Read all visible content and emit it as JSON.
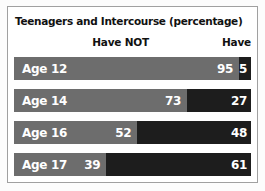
{
  "chart_data": {
    "type": "bar",
    "orientation": "horizontal",
    "stacked": true,
    "title": "Teenagers and Intercourse (percentage)",
    "categories": [
      "Age 12",
      "Age 14",
      "Age 16",
      "Age 17"
    ],
    "series": [
      {
        "name": "Have NOT",
        "values": [
          95,
          73,
          52,
          39
        ],
        "color": "#6d6d6d"
      },
      {
        "name": "Have",
        "values": [
          5,
          27,
          48,
          61
        ],
        "color": "#1d1d1d"
      }
    ],
    "xlim": [
      0,
      100
    ],
    "grid": false,
    "value_labels": true,
    "legend_position": "top",
    "colors": {
      "frame_border": "#a0a0a0",
      "panel_background": "#ffffff",
      "bar_text": "#ffffff",
      "title_text": "#111111"
    }
  }
}
